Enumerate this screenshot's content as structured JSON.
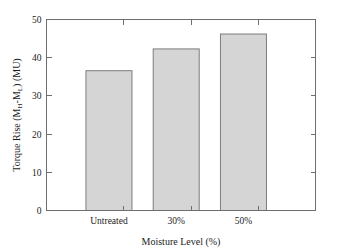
{
  "chart_data": {
    "type": "bar",
    "title": "",
    "categories": [
      "Untreated",
      "30%",
      "50%"
    ],
    "values": [
      36.6,
      42.3,
      46.2
    ],
    "series": [
      {
        "name": "Torque Rise",
        "values": [
          36.6,
          42.3,
          46.2
        ]
      }
    ],
    "xlabel": "Moisture Level (%)",
    "ylabel": "Torque Rise (MH-ML) (MU)",
    "ylabel_parts": {
      "lead": "Torque Rise (M",
      "sub1": "H",
      "mid": "-M",
      "sub2": "L",
      "tail": ") (MU)"
    },
    "ylim": [
      0,
      50
    ],
    "yticks": [
      "0",
      "10",
      "20",
      "30",
      "40",
      "50"
    ],
    "ytick_values": [
      0,
      10,
      20,
      30,
      40,
      50
    ],
    "xtick_labels": [
      "Untreated",
      "30%",
      "50%"
    ],
    "grid": false,
    "legend": "none",
    "bar_fill_color": "#d5d5d5",
    "bar_border_color": "#7d7d7d",
    "axis_color": "#6e6e6e",
    "background_color": "#ffffff"
  }
}
